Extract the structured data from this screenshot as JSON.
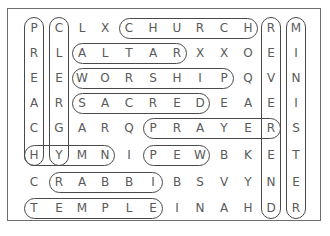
{
  "puzzle": {
    "type": "word-search",
    "rows": 8,
    "cols": 12,
    "grid": [
      [
        "P",
        "C",
        "L",
        "X",
        "C",
        "H",
        "U",
        "R",
        "C",
        "H",
        "R",
        "M"
      ],
      [
        "R",
        "L",
        "A",
        "L",
        "T",
        "A",
        "R",
        "X",
        "X",
        "O",
        "E",
        "I"
      ],
      [
        "E",
        "E",
        "W",
        "O",
        "R",
        "S",
        "H",
        "I",
        "P",
        "Q",
        "V",
        "N"
      ],
      [
        "A",
        "R",
        "S",
        "A",
        "C",
        "R",
        "E",
        "D",
        "E",
        "A",
        "E",
        "I"
      ],
      [
        "C",
        "G",
        "A",
        "R",
        "Q",
        "P",
        "R",
        "A",
        "Y",
        "E",
        "R",
        "S"
      ],
      [
        "H",
        "Y",
        "M",
        "N",
        "I",
        "P",
        "E",
        "W",
        "B",
        "K",
        "E",
        "T"
      ],
      [
        "C",
        "R",
        "A",
        "B",
        "B",
        "I",
        "B",
        "S",
        "V",
        "Y",
        "N",
        "E"
      ],
      [
        "T",
        "E",
        "M",
        "P",
        "L",
        "E",
        "I",
        "N",
        "A",
        "H",
        "D",
        "R"
      ]
    ],
    "found_words": [
      {
        "word": "CHURCH",
        "row": 0,
        "col": 4,
        "dir": "h",
        "len": 6
      },
      {
        "word": "ALTAR",
        "row": 1,
        "col": 2,
        "dir": "h",
        "len": 5
      },
      {
        "word": "WORSHIP",
        "row": 2,
        "col": 2,
        "dir": "h",
        "len": 7
      },
      {
        "word": "SACRED",
        "row": 3,
        "col": 2,
        "dir": "h",
        "len": 6
      },
      {
        "word": "PRAYER",
        "row": 4,
        "col": 5,
        "dir": "h",
        "len": 6
      },
      {
        "word": "HYMN",
        "row": 5,
        "col": 0,
        "dir": "h",
        "len": 4
      },
      {
        "word": "PEW",
        "row": 5,
        "col": 5,
        "dir": "h",
        "len": 3
      },
      {
        "word": "RABBI",
        "row": 6,
        "col": 1,
        "dir": "h",
        "len": 5
      },
      {
        "word": "TEMPLE",
        "row": 7,
        "col": 0,
        "dir": "h",
        "len": 6
      },
      {
        "word": "PREACH",
        "row": 0,
        "col": 0,
        "dir": "v",
        "len": 6
      },
      {
        "word": "CLERGY",
        "row": 0,
        "col": 1,
        "dir": "v",
        "len": 6
      },
      {
        "word": "REVEREND",
        "row": 0,
        "col": 10,
        "dir": "v",
        "len": 8
      },
      {
        "word": "MINISTER",
        "row": 0,
        "col": 11,
        "dir": "v",
        "len": 8
      }
    ],
    "colors": {
      "letters": "#5a5a5a",
      "ovals": "#4a4a4a",
      "frame": "#6e6e6e"
    }
  }
}
